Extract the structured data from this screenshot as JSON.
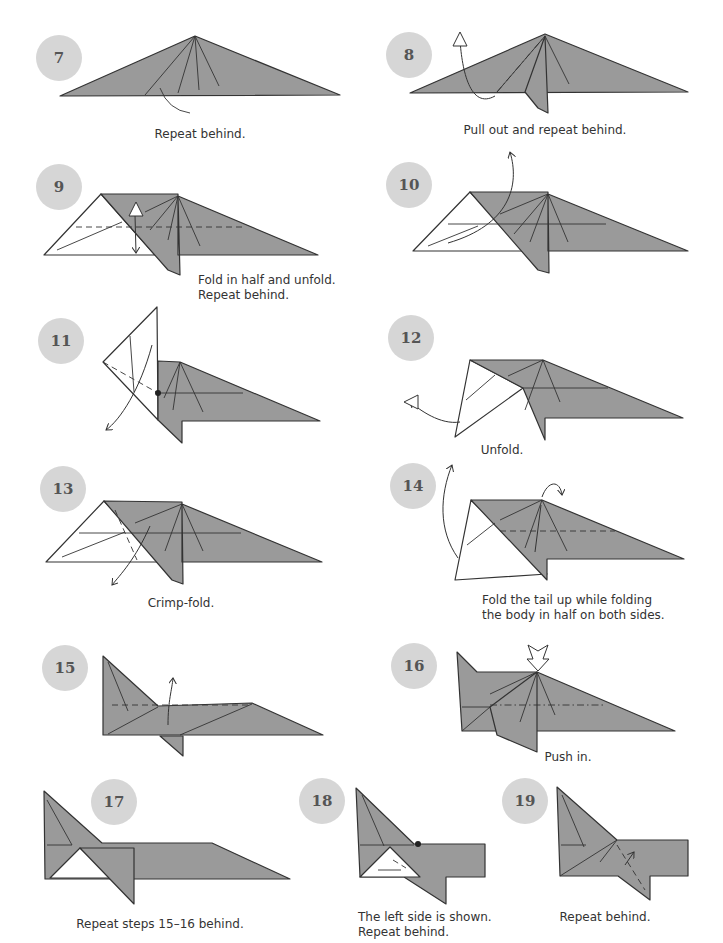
{
  "page": {
    "width": 723,
    "height": 943,
    "background": "#ffffff"
  },
  "colors": {
    "paper_gray": "#9a9a9a",
    "paper_white": "#ffffff",
    "edge": "#333333",
    "badge": "#d6d6d6",
    "badge_text": "#555555",
    "caption": "#333333"
  },
  "steps": [
    {
      "number": "7",
      "badge": {
        "x": 36,
        "y": 35
      },
      "caption": {
        "lines": [
          "Repeat behind."
        ],
        "x": 200,
        "y": 127,
        "align": "center"
      }
    },
    {
      "number": "8",
      "badge": {
        "x": 386,
        "y": 32
      },
      "caption": {
        "lines": [
          "Pull out and repeat behind."
        ],
        "x": 545,
        "y": 123,
        "align": "center"
      }
    },
    {
      "number": "9",
      "badge": {
        "x": 36,
        "y": 164
      },
      "caption": {
        "lines": [
          "Fold in half and unfold.",
          "Repeat behind."
        ],
        "x": 198,
        "y": 273,
        "align": "left"
      }
    },
    {
      "number": "10",
      "badge": {
        "x": 386,
        "y": 162
      },
      "caption": {
        "lines": [],
        "x": 0,
        "y": 0,
        "align": "left"
      }
    },
    {
      "number": "11",
      "badge": {
        "x": 38,
        "y": 318
      },
      "caption": {
        "lines": [],
        "x": 0,
        "y": 0,
        "align": "left"
      }
    },
    {
      "number": "12",
      "badge": {
        "x": 388,
        "y": 315
      },
      "caption": {
        "lines": [
          "Unfold."
        ],
        "x": 502,
        "y": 443,
        "align": "center"
      }
    },
    {
      "number": "13",
      "badge": {
        "x": 40,
        "y": 466
      },
      "caption": {
        "lines": [
          "Crimp-fold."
        ],
        "x": 181,
        "y": 596,
        "align": "center"
      }
    },
    {
      "number": "14",
      "badge": {
        "x": 390,
        "y": 463
      },
      "caption": {
        "lines": [
          "Fold the tail up while folding",
          "the body in half on both sides."
        ],
        "x": 482,
        "y": 593,
        "align": "left"
      }
    },
    {
      "number": "15",
      "badge": {
        "x": 42,
        "y": 645
      },
      "caption": {
        "lines": [],
        "x": 0,
        "y": 0,
        "align": "left"
      }
    },
    {
      "number": "16",
      "badge": {
        "x": 391,
        "y": 643
      },
      "caption": {
        "lines": [
          "Push in."
        ],
        "x": 568,
        "y": 750,
        "align": "center"
      }
    },
    {
      "number": "17",
      "badge": {
        "x": 91,
        "y": 779
      },
      "caption": {
        "lines": [
          "Repeat steps 15–16 behind."
        ],
        "x": 160,
        "y": 917,
        "align": "center"
      }
    },
    {
      "number": "18",
      "badge": {
        "x": 299,
        "y": 778
      },
      "caption": {
        "lines": [
          "The left side is shown.",
          "Repeat behind."
        ],
        "x": 358,
        "y": 910,
        "align": "left"
      }
    },
    {
      "number": "19",
      "badge": {
        "x": 502,
        "y": 778
      },
      "caption": {
        "lines": [
          "Repeat behind."
        ],
        "x": 605,
        "y": 910,
        "align": "center"
      }
    }
  ],
  "shapes": [
    {
      "step": "7",
      "fill": "gray",
      "points": "60,96 195,36 340,95"
    },
    {
      "step": "8",
      "fill": "gray",
      "points": "410,93 545,34 688,92"
    },
    {
      "step": "8",
      "fill": "gray",
      "points": "525,92 545,36 548,113 538,108"
    },
    {
      "step": "9",
      "fill": "white",
      "points": "44,255 101,194 155,255"
    },
    {
      "step": "9",
      "fill": "gray",
      "points": "101,194 178,194 178,255 318,255 178,196 180,275 168,270 101,194"
    },
    {
      "step": "10",
      "fill": "white",
      "points": "413,251 470,192 526,251"
    },
    {
      "step": "10",
      "fill": "gray",
      "points": "470,192 548,192 548,251 688,251 548,194 549,273 538,270 470,192"
    },
    {
      "step": "11",
      "fill": "white",
      "points": "103,362 157,307 158,420"
    },
    {
      "step": "11",
      "fill": "gray",
      "points": "158,361 180,362 320,421 182,421 182,443 158,420"
    },
    {
      "step": "12",
      "fill": "white",
      "points": "455,437 470,360 523,388"
    },
    {
      "step": "12",
      "fill": "gray",
      "points": "470,360 543,360 683,418 545,418 545,440 523,388"
    },
    {
      "step": "13",
      "fill": "white",
      "points": "46,562 104,501 160,562"
    },
    {
      "step": "13",
      "fill": "gray",
      "points": "104,501 182,502 182,562 322,562 182,504 183,584 172,580 104,501"
    },
    {
      "step": "14",
      "fill": "white",
      "points": "455,580 471,500 547,574"
    },
    {
      "step": "14",
      "fill": "gray",
      "points": "471,500 542,500 684,559 547,559 547,580 471,500"
    },
    {
      "step": "15",
      "fill": "gray",
      "points": "103,656 158,706 252,703 323,735 103,735"
    },
    {
      "step": "15",
      "fill": "gray",
      "points": "160,736 183,736 183,756"
    },
    {
      "step": "16",
      "fill": "gray",
      "points": "457,652 477,672 537,672 675,731 462,731"
    },
    {
      "step": "16",
      "fill": "gray",
      "points": "490,707 537,672 537,752 497,735"
    },
    {
      "step": "17",
      "fill": "gray",
      "points": "44,791 102,843 212,843 290,879 45,879"
    },
    {
      "step": "17",
      "fill": "white",
      "points": "50,878 80,848 113,878"
    },
    {
      "step": "17",
      "fill": "gray",
      "points": "80,848 134,848 134,904"
    },
    {
      "step": "18",
      "fill": "gray",
      "points": "356,788 414,844 485,844 485,877 446,877 446,904 404,877 360,877"
    },
    {
      "step": "18",
      "fill": "white",
      "points": "360,877 390,847 420,877"
    },
    {
      "step": "19",
      "fill": "gray",
      "points": "557,787 617,840 688,840 688,876 650,876 650,900 618,876 560,876"
    }
  ],
  "lines": [
    {
      "step": "7",
      "d": "M195,36 L145,95 M195,36 L178,93 M195,36 L199,90 M195,36 L219,86 M160,88 Q168,110 190,113",
      "style": "solid"
    },
    {
      "step": "8",
      "d": "M545,36 L497,92 M545,36 L569,84",
      "style": "solid"
    },
    {
      "step": "8",
      "d": "M497,92 L545,36",
      "style": "dashdot"
    },
    {
      "step": "8",
      "d": "M495,96 C470,110 462,70 460,40",
      "style": "arrow"
    },
    {
      "step": "9",
      "d": "M76,227 L245,227",
      "style": "dashed"
    },
    {
      "step": "9",
      "d": "M57,250 L122,222 M178,196 L145,212 M178,196 L150,230 M178,196 L168,240 M178,196 L200,246",
      "style": "solid"
    },
    {
      "step": "9",
      "d": "M135,215 L136,253",
      "style": "arrow"
    },
    {
      "step": "10",
      "d": "M448,224 L606,224 M428,246 L478,226 M548,194 L500,214 M548,194 L514,234 M548,194 L530,242 M548,194 L568,242",
      "style": "solid"
    },
    {
      "step": "10",
      "d": "M448,243 C510,225 520,185 510,152",
      "style": "arrow"
    },
    {
      "step": "11",
      "d": "M103,362 L158,393",
      "style": "dashed"
    },
    {
      "step": "11",
      "d": "M158,393 L243,393 M180,362 L164,398 M180,362 L173,410 M180,362 L203,412 M130,336 L134,392",
      "style": "solid"
    },
    {
      "step": "11",
      "d": "M152,345 C140,390 120,420 106,430",
      "style": "arrow"
    },
    {
      "step": "12",
      "d": "M523,388 L608,388 M543,360 L508,376 M543,360 L525,410 M543,360 L560,402 M466,400 L495,375",
      "style": "solid"
    },
    {
      "step": "12",
      "d": "M460,422 C440,425 420,410 410,402",
      "style": "arrow"
    },
    {
      "step": "13",
      "d": "M79,533 L241,533 M62,557 L125,532 M182,504 L135,523 M182,504 L165,551 M182,504 L203,551",
      "style": "solid"
    },
    {
      "step": "13",
      "d": "M115,510 L137,560",
      "style": "dashed"
    },
    {
      "step": "13",
      "d": "M150,526 C135,560 120,575 112,585",
      "style": "arrow"
    },
    {
      "step": "14",
      "d": "M500,531 L615,531",
      "style": "dashed"
    },
    {
      "step": "14",
      "d": "M542,500 L500,520 M542,500 L525,548 M542,500 L567,551 M467,545 L495,523",
      "style": "solid"
    },
    {
      "step": "14",
      "d": "M458,558 C438,530 440,495 452,465",
      "style": "arrow"
    },
    {
      "step": "14",
      "d": "M541,505 L535,552 M542,497 C548,480 560,480 562,495",
      "style": "arrow"
    },
    {
      "step": "15",
      "d": "M112,705 L250,705",
      "style": "dashed"
    },
    {
      "step": "15",
      "d": "M108,662 L128,711 M108,734 L158,707 M180,735 L252,704",
      "style": "solid"
    },
    {
      "step": "15",
      "d": "M168,725 C168,700 172,690 173,678",
      "style": "arrow"
    },
    {
      "step": "16",
      "d": "M490,705 L605,705",
      "style": "dashdot"
    },
    {
      "step": "16",
      "d": "M462,731 L490,707 L462,707 M537,672 L490,694 M537,672 L520,722 M537,672 L555,715",
      "style": "solid"
    },
    {
      "step": "17",
      "d": "M47,800 L72,845 M47,845 L72,845",
      "style": "solid"
    },
    {
      "step": "18",
      "d": "M360,845 L414,845 M362,795 L384,846 M378,870 L401,870",
      "style": "solid"
    },
    {
      "step": "18",
      "d": "M393,860 L406,868",
      "style": "dashed"
    },
    {
      "step": "19",
      "d": "M561,845 L586,845 M562,795 L584,847 M560,876 L617,840 L600,862",
      "style": "solid"
    },
    {
      "step": "19",
      "d": "M617,845 L645,890",
      "style": "dashed"
    },
    {
      "step": "19",
      "d": "M625,865 L634,852",
      "style": "arrow"
    }
  ],
  "points": [
    {
      "step": "11",
      "x": 158,
      "y": 393
    },
    {
      "step": "18",
      "x": 418,
      "y": 844
    }
  ],
  "hollow_arrows": [
    {
      "step": "16",
      "x": 538,
      "y": 645,
      "direction": "down"
    },
    {
      "step": "8",
      "x": 460,
      "y": 40,
      "direction": "up"
    },
    {
      "step": "9",
      "x": 136,
      "y": 210,
      "direction": "up"
    },
    {
      "step": "12",
      "x": 412,
      "y": 402,
      "direction": "left"
    }
  ]
}
